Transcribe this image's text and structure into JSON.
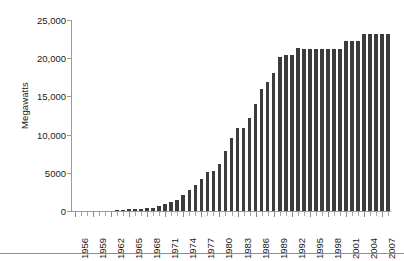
{
  "chart_data": {
    "type": "bar",
    "title": "",
    "subtitle": "",
    "xlabel": "",
    "ylabel": "Megawatts",
    "ylim": [
      0,
      25000
    ],
    "y_ticks": [
      0,
      5000,
      10000,
      15000,
      20000,
      25000
    ],
    "y_tick_labels": [
      "0",
      "5000",
      "10,000",
      "15,000",
      "20,000",
      "25,000"
    ],
    "grid": false,
    "legend": "none",
    "bar_color": "#3c3c3c",
    "axis_color": "#9a9a9a",
    "x_tick_label_interval": 3,
    "x_tick_labels": [
      "1956",
      "1959",
      "1962",
      "1965",
      "1968",
      "1971",
      "1974",
      "1977",
      "1980",
      "1983",
      "1986",
      "1989",
      "1992",
      "1995",
      "1998",
      "2001",
      "2004",
      "2007"
    ],
    "categories": [
      "1956",
      "1957",
      "1958",
      "1959",
      "1960",
      "1961",
      "1962",
      "1963",
      "1964",
      "1965",
      "1966",
      "1967",
      "1968",
      "1969",
      "1970",
      "1971",
      "1972",
      "1973",
      "1974",
      "1975",
      "1976",
      "1977",
      "1978",
      "1979",
      "1980",
      "1981",
      "1982",
      "1983",
      "1984",
      "1985",
      "1986",
      "1987",
      "1988",
      "1989",
      "1990",
      "1991",
      "1992",
      "1993",
      "1994",
      "1995",
      "1996",
      "1997",
      "1998",
      "1999",
      "2000",
      "2001",
      "2002",
      "2003",
      "2004",
      "2005",
      "2006",
      "2007",
      "2008"
    ],
    "values": [
      0,
      0,
      0,
      0,
      0,
      0,
      0,
      100,
      150,
      200,
      250,
      300,
      350,
      400,
      600,
      900,
      1200,
      1500,
      2100,
      2700,
      3400,
      4200,
      5100,
      5300,
      6100,
      7900,
      9500,
      10900,
      10900,
      12200,
      14000,
      16000,
      16900,
      18000,
      20200,
      20400,
      20400,
      21300,
      21200,
      21200,
      21200,
      21200,
      21200,
      21200,
      21200,
      22200,
      22200,
      22200,
      23200,
      23200,
      23200,
      23200,
      23200
    ]
  }
}
